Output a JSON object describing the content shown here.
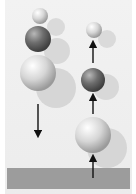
{
  "diagram": {
    "title": "",
    "left_stack": {
      "label": "before impact",
      "balls": [
        {
          "name": "small-ball",
          "shade": "light"
        },
        {
          "name": "medium-ball",
          "shade": "dark"
        },
        {
          "name": "large-ball",
          "shade": "light"
        }
      ],
      "arrow_direction": "down"
    },
    "right_stack": {
      "label": "after impact",
      "balls": [
        {
          "name": "small-ball",
          "shade": "light"
        },
        {
          "name": "medium-ball",
          "shade": "dark"
        },
        {
          "name": "large-ball",
          "shade": "light"
        }
      ],
      "arrow_direction": "up"
    },
    "colors": {
      "background": "#ececec",
      "floor": "#9c9c9c",
      "light_ball": "#d8d8d8",
      "dark_ball": "#6e6e6e",
      "shadow": "#d4d4d4",
      "arrow": "#111111"
    }
  }
}
